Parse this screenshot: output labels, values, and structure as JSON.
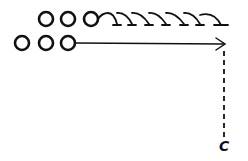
{
  "diagram": {
    "type": "play-diagram",
    "stroke_color": "#111111",
    "background": "#ffffff",
    "top_row": {
      "players": [
        {
          "id": "top-1",
          "cx": 46,
          "cy": 19
        },
        {
          "id": "top-2",
          "cx": 68,
          "cy": 19
        },
        {
          "id": "top-3",
          "cx": 91,
          "cy": 19
        }
      ],
      "path": {
        "style": "looping-with-ticks",
        "from_x": 98,
        "to_x": 233,
        "baseline_y": 25,
        "loops": 6
      }
    },
    "bottom_row": {
      "players": [
        {
          "id": "bottom-1",
          "cx": 22,
          "cy": 43
        },
        {
          "id": "bottom-2",
          "cx": 46,
          "cy": 43
        },
        {
          "id": "bottom-3",
          "cx": 68,
          "cy": 43
        }
      ],
      "path": {
        "style": "solid-arrow",
        "from_x": 75,
        "to_x": 225,
        "y": 43
      }
    },
    "dashed_line": {
      "x": 224,
      "from_y": 51,
      "to_y": 139
    },
    "end_label": {
      "text": "C",
      "x": 219,
      "y": 139
    }
  }
}
